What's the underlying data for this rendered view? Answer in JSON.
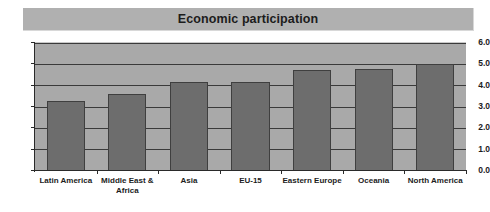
{
  "chart_data": {
    "type": "bar",
    "title": "Economic participation",
    "xlabel": "",
    "ylabel": "",
    "categories": [
      "Latin America",
      "Middle East & Africa",
      "Asia",
      "EU-15",
      "Eastern Europe",
      "Oceania",
      "North America"
    ],
    "values": [
      3.3,
      3.6,
      4.15,
      4.15,
      4.75,
      4.8,
      5.0
    ],
    "ylim": [
      0.0,
      6.0
    ],
    "ytick_labels": [
      "0.0",
      "1.0",
      "2.0",
      "3.0",
      "4.0",
      "5.0",
      "6.0"
    ],
    "ytick_values": [
      0.0,
      1.0,
      2.0,
      3.0,
      4.0,
      5.0,
      6.0
    ],
    "grid": true,
    "legend": "none",
    "colors": {
      "bar_fill": "#6d6d6d",
      "bar_border": "#3f3f3f",
      "plot_background": "#a9a9a9",
      "title_band": "#b0b0b0",
      "gridline": "#3a3a3a",
      "axis": "#2a2a2a",
      "text": "#1c1c1c",
      "page_background": "#ffffff"
    }
  }
}
